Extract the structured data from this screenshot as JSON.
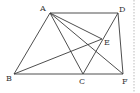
{
  "diagram": {
    "points": {
      "A": {
        "x": 50,
        "y": 13,
        "label": "A",
        "lx": 40,
        "ly": 11
      },
      "D": {
        "x": 118,
        "y": 13,
        "label": "D",
        "lx": 119,
        "ly": 12
      },
      "E": {
        "x": 102,
        "y": 39,
        "label": "E",
        "lx": 104,
        "ly": 45
      },
      "B": {
        "x": 14,
        "y": 74,
        "label": "B",
        "lx": 6,
        "ly": 81
      },
      "C": {
        "x": 83,
        "y": 74,
        "label": "C",
        "lx": 79,
        "ly": 84
      },
      "F": {
        "x": 123,
        "y": 74,
        "label": "F",
        "lx": 122,
        "ly": 84
      }
    },
    "segments": [
      [
        "A",
        "D"
      ],
      [
        "A",
        "B"
      ],
      [
        "A",
        "C"
      ],
      [
        "A",
        "E"
      ],
      [
        "A",
        "F"
      ],
      [
        "D",
        "F"
      ],
      [
        "D",
        "C"
      ],
      [
        "B",
        "E"
      ],
      [
        "B",
        "F"
      ]
    ],
    "dashed_border_x": 134
  }
}
